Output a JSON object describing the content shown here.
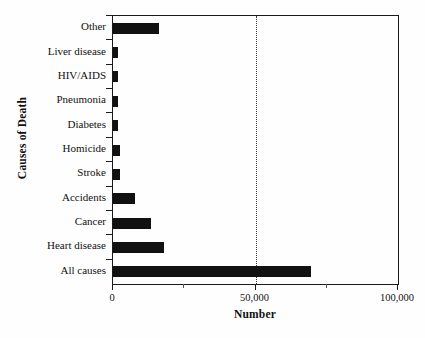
{
  "chart_data": {
    "type": "bar",
    "orientation": "horizontal",
    "title": "",
    "xlabel": "Number",
    "ylabel": "Causes of Death",
    "categories": [
      "All causes",
      "Heart disease",
      "Cancer",
      "Accidents",
      "Stroke",
      "Homicide",
      "Diabetes",
      "Pneumonia",
      "HIV/AIDS",
      "Liver disease",
      "Other"
    ],
    "values": [
      69500,
      18000,
      13300,
      7700,
      2500,
      2500,
      1600,
      1600,
      1600,
      1600,
      16000
    ],
    "xlim": [
      0,
      100000
    ],
    "xticks": [
      0,
      50000,
      100000
    ],
    "xtick_labels": [
      "0",
      "50,000",
      "100,000"
    ],
    "minor_xticks": [
      25000,
      75000
    ],
    "gridlines": [
      50000
    ],
    "grid": "vertical-dotted-at-50000",
    "bar_color": "#111111",
    "axis_color": "#1a1a1a",
    "background": "#ffffff",
    "legend": "none"
  }
}
